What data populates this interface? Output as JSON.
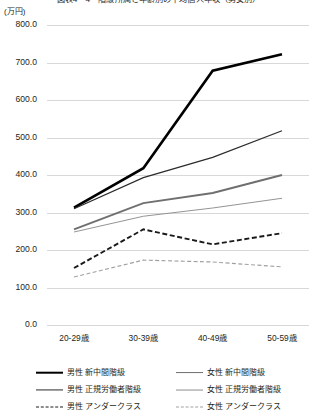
{
  "title": "図表4－4　階級所属と年齢別の平均個人年収（男女別）",
  "unit_label": "(万円)",
  "chart_data": {
    "type": "line",
    "title": "図表4－4　階級所属と年齢別の平均個人年収（男女別）",
    "xlabel": "",
    "ylabel": "(万円)",
    "ylim": [
      0,
      800
    ],
    "ytick_step": 100,
    "grid": true,
    "legend_position": "bottom",
    "categories": [
      "20-29歳",
      "30-39歳",
      "40-49歳",
      "50-59歳"
    ],
    "ytick_labels": [
      "800.0",
      "700.0",
      "600.0",
      "500.0",
      "400.0",
      "300.0",
      "200.0",
      "100.0",
      "0.0"
    ],
    "series": [
      {
        "name": "男性 新中間階級",
        "style": "solid",
        "width": "thick",
        "color": "#000000",
        "values": [
          313,
          418,
          678,
          722
        ]
      },
      {
        "name": "女性 新中間階級",
        "style": "solid",
        "width": "medium",
        "color": "#6f6f6f",
        "values": [
          255,
          325,
          352,
          400
        ]
      },
      {
        "name": "男性 正規労働者階級",
        "style": "solid",
        "width": "thin",
        "color": "#2b2b2b",
        "values": [
          310,
          393,
          447,
          518
        ]
      },
      {
        "name": "女性 正規労働者階級",
        "style": "solid",
        "width": "thin-light",
        "color": "#8e8e8e",
        "values": [
          248,
          290,
          312,
          338
        ]
      },
      {
        "name": "男性 アンダークラス",
        "style": "dashed",
        "width": "medium",
        "color": "#1a1a1a",
        "values": [
          152,
          255,
          215,
          245
        ]
      },
      {
        "name": "女性 アンダークラス",
        "style": "dashed",
        "width": "thin",
        "color": "#a0a0a0",
        "values": [
          128,
          173,
          168,
          155
        ]
      }
    ]
  },
  "legend": {
    "left": [
      {
        "label": "男性 新中間階級",
        "series_index": 0
      },
      {
        "label": "男性 正規労働者階級",
        "series_index": 2
      },
      {
        "label": "男性 アンダークラス",
        "series_index": 4
      }
    ],
    "right": [
      {
        "label": "女性 新中間階級",
        "series_index": 1
      },
      {
        "label": "女性 正規労働者階級",
        "series_index": 3
      },
      {
        "label": "女性 アンダークラス",
        "series_index": 5
      }
    ]
  }
}
